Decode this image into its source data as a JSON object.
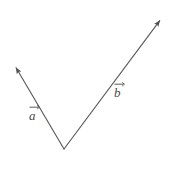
{
  "figure": {
    "background_color": "#ffffff",
    "stroke_color": "#5a5a5a",
    "label_color": "#4a4a4a",
    "width": 172,
    "height": 186
  },
  "labels": {
    "vector_a": "a",
    "vector_b": "b"
  },
  "chart_data": {
    "type": "diagram",
    "title": "",
    "xlabel": "",
    "ylabel": "",
    "grid": false,
    "legend": null,
    "common_origin": {
      "x": 64,
      "y": 149
    },
    "vectors": [
      {
        "name": "a",
        "label": "a",
        "label_accent": "vector-arrow",
        "tail": {
          "x": 64,
          "y": 149
        },
        "head": {
          "x": 15,
          "y": 66
        },
        "head_arrow": true,
        "label_position": {
          "x": 29,
          "y": 104
        },
        "length_px": 96,
        "angle_deg": 120.5
      },
      {
        "name": "b",
        "label": "b",
        "label_accent": "vector-arrow",
        "tail": {
          "x": 64,
          "y": 149
        },
        "head": {
          "x": 161,
          "y": 19
        },
        "head_arrow": true,
        "label_position": {
          "x": 114,
          "y": 81
        },
        "length_px": 162,
        "angle_deg": 53.3
      }
    ]
  }
}
